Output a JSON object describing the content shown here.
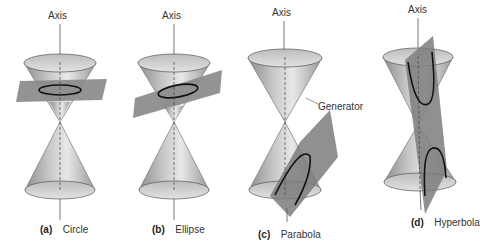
{
  "figure": {
    "panels": [
      {
        "id": "a",
        "letter": "(a)",
        "name": "Circle",
        "axis_label": "Axis"
      },
      {
        "id": "b",
        "letter": "(b)",
        "name": "Ellipse",
        "axis_label": "Axis"
      },
      {
        "id": "c",
        "letter": "(c)",
        "name": "Parabola",
        "axis_label": "Axis",
        "extra_label": "Generator"
      },
      {
        "id": "d",
        "letter": "(d)",
        "name": "Hyperbola",
        "axis_label": "Axis"
      }
    ]
  },
  "colors": {
    "cone_light": "#e6e6e6",
    "cone_mid": "#bdbdbd",
    "cone_dark": "#8f8f8f",
    "plane": "#8a8a8a",
    "curve": "#111111",
    "axis": "#555555",
    "text": "#333333"
  }
}
